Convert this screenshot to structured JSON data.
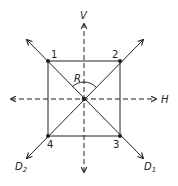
{
  "diagram": {
    "type": "symmetry-axes-of-square",
    "colors": {
      "stroke": "#222222",
      "background": "#ffffff"
    },
    "axes": {
      "vertical": {
        "label": "V",
        "style": "dashed",
        "bidirectional": true
      },
      "horizontal": {
        "label": "H",
        "style": "dashed",
        "bidirectional": true
      },
      "diagonal_1": {
        "label_main": "D",
        "label_sub": "1",
        "style": "solid",
        "bidirectional": true
      },
      "diagonal_2": {
        "label_main": "D",
        "label_sub": "2",
        "style": "solid",
        "bidirectional": true
      }
    },
    "vertices": [
      {
        "label": "1",
        "position": "top-left"
      },
      {
        "label": "2",
        "position": "top-right"
      },
      {
        "label": "3",
        "position": "bottom-right"
      },
      {
        "label": "4",
        "position": "bottom-left"
      }
    ],
    "rotation": {
      "label": "R",
      "center": "square-center"
    }
  }
}
